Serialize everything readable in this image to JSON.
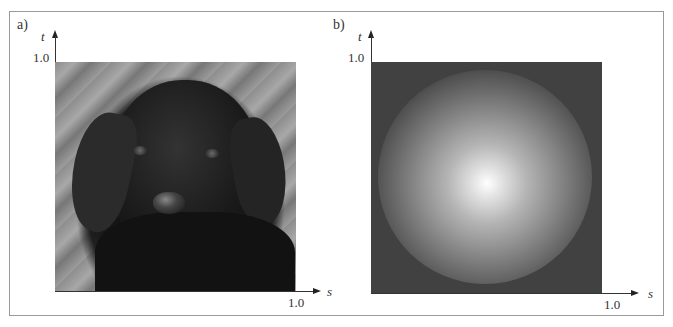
{
  "figure": {
    "panels": [
      {
        "label": "a)",
        "content": "photograph of a black puppy (grayscale texture image)",
        "vertical_axis": {
          "variable": "t",
          "tick": "1.0"
        },
        "horizontal_axis": {
          "variable": "s",
          "tick": "1.0"
        }
      },
      {
        "label": "b)",
        "content": "shaded sphere on dark gray background",
        "vertical_axis": {
          "variable": "t",
          "tick": "1.0"
        },
        "horizontal_axis": {
          "variable": "s",
          "tick": "1.0"
        }
      }
    ],
    "colors": {
      "frame_border": "#9a9a9a",
      "sphere_background": "#414141",
      "sphere_highlight": "#ffffff",
      "axis": "#333333"
    }
  }
}
